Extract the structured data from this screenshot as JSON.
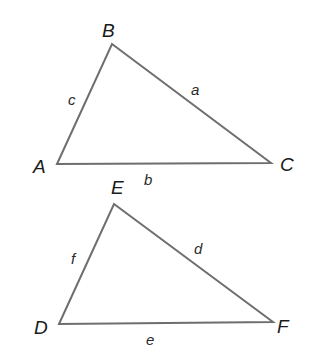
{
  "diagram": {
    "type": "two similar triangles",
    "colors": {
      "edge": "#6e6e6e",
      "text": "#1a1a1a",
      "background": "#ffffff"
    },
    "triangles": [
      {
        "name": "ABC",
        "vertices": [
          {
            "label": "A",
            "x": 57,
            "y": 164
          },
          {
            "label": "B",
            "x": 112,
            "y": 44
          },
          {
            "label": "C",
            "x": 271,
            "y": 163
          }
        ],
        "sides": [
          {
            "label": "c",
            "between": "A-B"
          },
          {
            "label": "a",
            "between": "B-C"
          },
          {
            "label": "b",
            "between": "A-C"
          }
        ]
      },
      {
        "name": "DEF",
        "vertices": [
          {
            "label": "D",
            "x": 59,
            "y": 324
          },
          {
            "label": "E",
            "x": 114,
            "y": 204
          },
          {
            "label": "F",
            "x": 273,
            "y": 322
          }
        ],
        "sides": [
          {
            "label": "f",
            "between": "D-E"
          },
          {
            "label": "d",
            "between": "E-F"
          },
          {
            "label": "e",
            "between": "D-F"
          }
        ]
      }
    ]
  }
}
